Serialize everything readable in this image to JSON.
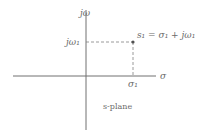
{
  "diagram": {
    "title": "s-plane",
    "axes": {
      "vertical_label": "jω",
      "horizontal_label": "σ"
    },
    "point": {
      "label": "s₁ = σ₁ + jω₁",
      "x_label": "σ₁",
      "y_label": "jω₁"
    },
    "plane_label": "s-plane",
    "colors": {
      "axis": "#707070",
      "dashed": "#808080",
      "point": "#505050",
      "text": "#6a6a6a"
    }
  }
}
